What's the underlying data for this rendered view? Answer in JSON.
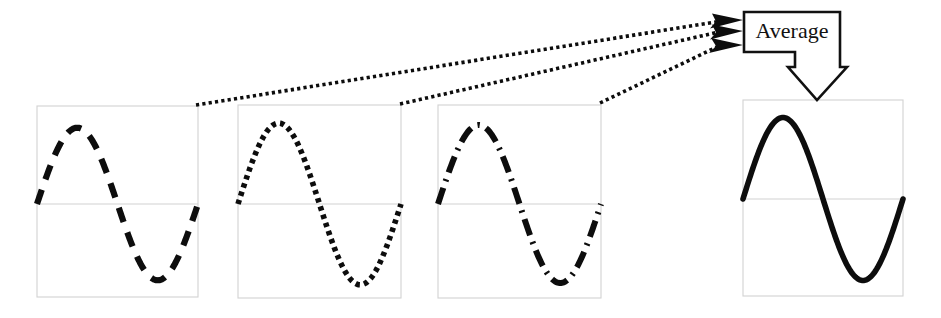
{
  "figure": {
    "title": "Average",
    "caption_text": "Average",
    "background_color": "#ffffff",
    "ink_color": "#0d0d0d",
    "frame_color": "#d2d2d2"
  },
  "callout": {
    "label": "Average",
    "box": {
      "x": 744,
      "y": 12,
      "width": 96,
      "height": 40
    },
    "border_color": "#111111",
    "fill_color": "#ffffff",
    "arrow_tip": {
      "x": 817,
      "y": 100
    }
  },
  "chart_data": {
    "type": "line",
    "title": "Average",
    "xlabel": "",
    "ylabel": "",
    "grid": false,
    "legend_position": "none",
    "xlim": [
      0,
      1
    ],
    "ylim": [
      -1,
      1
    ],
    "panels": [
      {
        "id": "panel-1",
        "name": "input-signal-1",
        "line_style": "dashed",
        "series": [
          {
            "name": "signal-1",
            "cycles": 1,
            "amplitude": 0.82,
            "phase": 0,
            "x": [
              0,
              0.1,
              0.2,
              0.25,
              0.3,
              0.4,
              0.5,
              0.6,
              0.7,
              0.75,
              0.8,
              0.9,
              1.0
            ],
            "values": [
              0,
              0.48,
              0.78,
              0.82,
              0.78,
              0.48,
              0,
              -0.48,
              -0.78,
              -0.82,
              -0.78,
              -0.48,
              0
            ]
          }
        ],
        "box": {
          "x": 37,
          "y": 106,
          "width": 161,
          "height": 191
        },
        "midline_y": 204
      },
      {
        "id": "panel-2",
        "name": "input-signal-2",
        "line_style": "dotted",
        "series": [
          {
            "name": "signal-2",
            "cycles": 1,
            "amplitude": 0.86,
            "phase": 0,
            "x": [
              0,
              0.1,
              0.2,
              0.25,
              0.3,
              0.4,
              0.5,
              0.6,
              0.7,
              0.75,
              0.8,
              0.9,
              1.0
            ],
            "values": [
              0,
              0.5,
              0.82,
              0.86,
              0.82,
              0.5,
              0,
              -0.5,
              -0.82,
              -0.86,
              -0.82,
              -0.5,
              0
            ]
          }
        ],
        "box": {
          "x": 238,
          "y": 105,
          "width": 163,
          "height": 193
        },
        "midline_y": 204
      },
      {
        "id": "panel-3",
        "name": "input-signal-3",
        "line_style": "dash-dot",
        "series": [
          {
            "name": "signal-3",
            "cycles": 1,
            "amplitude": 0.84,
            "phase": 0,
            "x": [
              0,
              0.1,
              0.2,
              0.25,
              0.3,
              0.4,
              0.5,
              0.6,
              0.7,
              0.75,
              0.8,
              0.9,
              1.0
            ],
            "values": [
              0,
              0.49,
              0.8,
              0.84,
              0.8,
              0.49,
              0,
              -0.49,
              -0.8,
              -0.84,
              -0.8,
              -0.49,
              0
            ]
          }
        ],
        "box": {
          "x": 438,
          "y": 105,
          "width": 163,
          "height": 193
        },
        "midline_y": 204
      },
      {
        "id": "panel-4",
        "name": "averaged-output-signal",
        "line_style": "solid",
        "series": [
          {
            "name": "average-signal",
            "cycles": 1,
            "amplitude": 0.84,
            "phase": 0,
            "x": [
              0,
              0.1,
              0.2,
              0.25,
              0.3,
              0.4,
              0.5,
              0.6,
              0.7,
              0.75,
              0.8,
              0.9,
              1.0
            ],
            "values": [
              0,
              0.49,
              0.8,
              0.84,
              0.8,
              0.49,
              0,
              -0.49,
              -0.8,
              -0.84,
              -0.8,
              -0.49,
              0
            ]
          }
        ],
        "box": {
          "x": 743,
          "y": 100,
          "width": 160,
          "height": 196
        },
        "midline_y": 199
      }
    ],
    "connectors": [
      {
        "name": "leader-panel-1",
        "from": {
          "x": 196,
          "y": 105
        },
        "to": {
          "x": 733,
          "y": 20
        }
      },
      {
        "name": "leader-panel-2",
        "from": {
          "x": 400,
          "y": 104
        },
        "to": {
          "x": 733,
          "y": 31
        }
      },
      {
        "name": "leader-panel-3",
        "from": {
          "x": 600,
          "y": 103
        },
        "to": {
          "x": 733,
          "y": 45
        }
      }
    ]
  }
}
